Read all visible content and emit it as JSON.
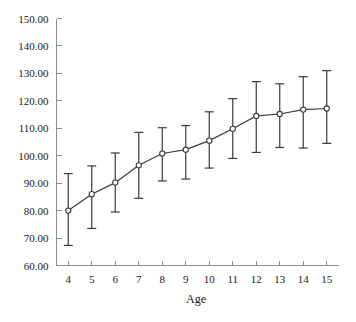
{
  "chart_data": {
    "type": "line",
    "title": "",
    "subtitle": "",
    "xlabel": "Age",
    "ylabel": "",
    "x": [
      4,
      5,
      6,
      7,
      8,
      9,
      10,
      11,
      12,
      13,
      14,
      15
    ],
    "xticklabels": [
      "4",
      "5",
      "6",
      "7",
      "8",
      "9",
      "10",
      "11",
      "12",
      "13",
      "14",
      "15"
    ],
    "yticklabels": [
      "60.00",
      "70.00",
      "80.00",
      "90.00",
      "100.00",
      "110.00",
      "120.00",
      "130.00",
      "140.00",
      "150.00"
    ],
    "ytickvalues": [
      60,
      70,
      80,
      90,
      100,
      110,
      120,
      130,
      140,
      150
    ],
    "xlim": [
      3.5,
      15.5
    ],
    "ylim": [
      60,
      150
    ],
    "grid": false,
    "legend": null,
    "error_bar_style": "capped",
    "marker": "open-circle",
    "series": [
      {
        "name": "mean",
        "values": [
          80.0,
          86.0,
          90.2,
          96.5,
          100.8,
          102.2,
          105.5,
          109.8,
          114.5,
          115.2,
          116.8,
          117.2
        ],
        "error_upper": [
          93.5,
          96.3,
          101.0,
          108.5,
          110.2,
          111.0,
          116.0,
          120.8,
          127.0,
          126.2,
          128.8,
          131.0
        ],
        "error_lower": [
          67.3,
          73.5,
          79.5,
          84.5,
          90.8,
          91.5,
          95.5,
          99.0,
          101.2,
          103.0,
          102.8,
          104.5
        ]
      }
    ]
  },
  "axis": {
    "x_title": "Age"
  }
}
